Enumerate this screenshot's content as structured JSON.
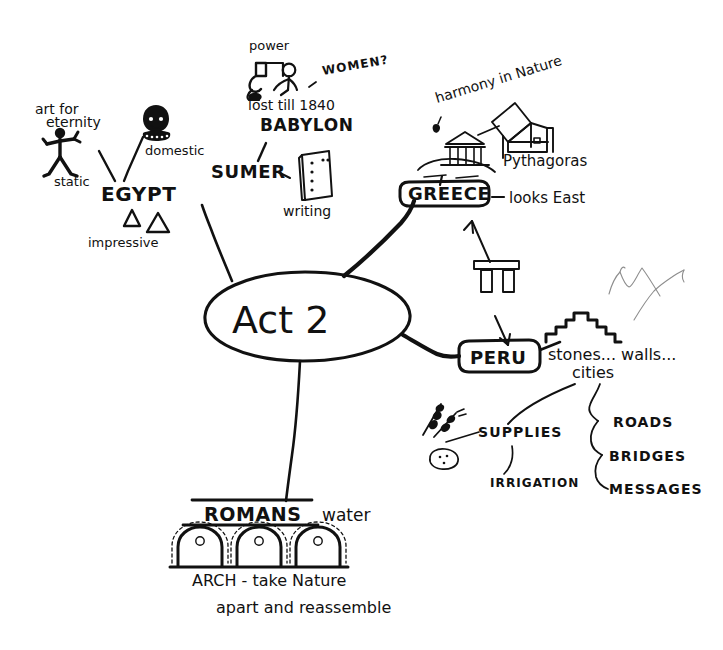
{
  "diagram": {
    "title": "Act 2",
    "type": "hand-drawn-mind-map",
    "center": {
      "label": "Act 2",
      "shape": "ellipse"
    },
    "branches": [
      {
        "id": "egypt",
        "label": "EGYPT",
        "shape": "plain-text",
        "notes": [
          {
            "id": "art-for-eternity",
            "line1": "art for",
            "line2": "eternity"
          },
          {
            "id": "static",
            "label": "static"
          },
          {
            "id": "domestic",
            "label": "domestic"
          },
          {
            "id": "impressive",
            "label": "impressive"
          }
        ],
        "icons": [
          {
            "name": "egyptian-figure-icon",
            "label": "static"
          },
          {
            "name": "bust-head-icon",
            "label": "domestic"
          },
          {
            "name": "pyramid-icon",
            "label": "impressive"
          }
        ]
      },
      {
        "id": "sumer",
        "label": "SUMER",
        "shape": "plain-text",
        "notes": [
          {
            "id": "writing",
            "label": "writing"
          }
        ],
        "icons": [
          {
            "name": "clay-tablet-icon",
            "label": "writing"
          }
        ]
      },
      {
        "id": "babylon",
        "label": "BABYLON",
        "shape": "plain-text",
        "notes": [
          {
            "id": "power",
            "label": "power"
          },
          {
            "id": "women",
            "label": "WOMEN?"
          },
          {
            "id": "lost-till-1840",
            "label": "lost till 1840"
          }
        ],
        "icons": [
          {
            "name": "two-figures-icon",
            "label": "power"
          }
        ]
      },
      {
        "id": "greece",
        "label": "GREECE",
        "shape": "rounded-box",
        "notes": [
          {
            "id": "harmony-in-nature",
            "label": "harmony in Nature"
          },
          {
            "id": "pythagoras",
            "label": "Pythagoras"
          },
          {
            "id": "looks-east",
            "label": "looks East"
          }
        ],
        "icons": [
          {
            "name": "greek-temple-icon",
            "label": "harmony in Nature"
          },
          {
            "name": "pythagoras-theorem-icon",
            "label": "Pythagoras"
          },
          {
            "name": "trilithon-icon",
            "label": "looks East"
          }
        ]
      },
      {
        "id": "peru",
        "label": "PERU",
        "shape": "rounded-box",
        "notes": [
          {
            "id": "stones-walls-cities-1",
            "label": "stones... walls..."
          },
          {
            "id": "stones-walls-cities-2",
            "label": "cities"
          },
          {
            "id": "supplies",
            "label": "SUPPLIES"
          },
          {
            "id": "irrigation",
            "label": "IRRIGATION"
          },
          {
            "id": "roads",
            "label": "ROADS"
          },
          {
            "id": "bridges",
            "label": "BRIDGES"
          },
          {
            "id": "messages",
            "label": "MESSAGES"
          }
        ],
        "icons": [
          {
            "name": "inca-wall-icon",
            "label": "stones... walls... cities"
          },
          {
            "name": "wheat-stalks-icon",
            "label": "SUPPLIES"
          },
          {
            "name": "potato-icon",
            "label": "SUPPLIES"
          },
          {
            "name": "mountains-icon",
            "label": ""
          }
        ]
      },
      {
        "id": "romans",
        "label": "ROMANS",
        "shape": "underlined-heading",
        "notes": [
          {
            "id": "water",
            "label": "water"
          },
          {
            "id": "arch-line1",
            "label": "ARCH - take Nature"
          },
          {
            "id": "arch-line2",
            "label": "apart and reassemble"
          }
        ],
        "icons": [
          {
            "name": "aqueduct-arches-icon",
            "label": "ARCH"
          }
        ]
      }
    ],
    "colors": {
      "ink": "#111111",
      "faint_ink": "#8d8d8d",
      "paper": "#ffffff"
    }
  }
}
